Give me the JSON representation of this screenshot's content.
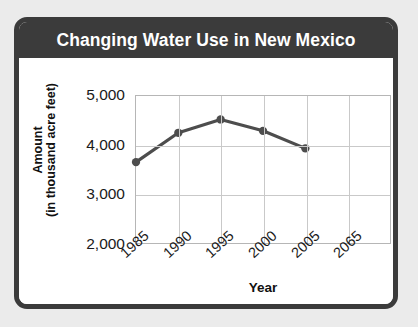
{
  "card": {
    "title": "Changing Water Use in New Mexico",
    "title_bar_color": "#3b3b3b",
    "border_color": "#3b3b3b",
    "background_color": "#ffffff",
    "page_background_color": "#ebebeb"
  },
  "chart_data": {
    "type": "line",
    "title": "Changing Water Use in New Mexico",
    "xlabel": "Year",
    "ylabel": "Amount (in thousand acre feet)",
    "ylabel_line1": "Amount",
    "ylabel_line2": "(in thousand acre feet)",
    "categories": [
      "1985",
      "1990",
      "1995",
      "2000",
      "2005",
      "2065"
    ],
    "x_tick_labels": [
      "1985",
      "1990",
      "1995",
      "2000",
      "2005",
      "2065"
    ],
    "y_tick_labels": [
      "5,000",
      "4,000",
      "3,000",
      "2,000"
    ],
    "y_tick_values": [
      5000,
      4000,
      3000,
      2000
    ],
    "values": [
      3650,
      4250,
      4520,
      4290,
      3930,
      null
    ],
    "points": [
      {
        "x": "1985",
        "y": 3650
      },
      {
        "x": "1990",
        "y": 4250
      },
      {
        "x": "1995",
        "y": 4520
      },
      {
        "x": "2000",
        "y": 4290
      },
      {
        "x": "2005",
        "y": 3930
      }
    ],
    "ylim": [
      2000,
      5000
    ],
    "grid": true,
    "legend": false,
    "series_color": "#4d4d4d",
    "grid_color": "#c9c9c9",
    "axis_color": "#b6b6b6"
  }
}
